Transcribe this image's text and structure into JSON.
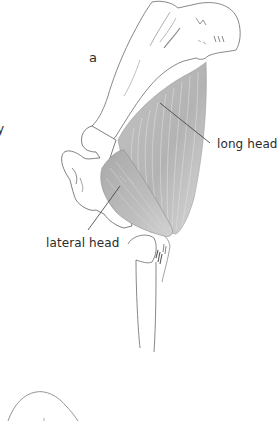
{
  "figure": {
    "panel_label": "a",
    "cut_off_left_text": "y",
    "labels": {
      "long_head": "long head",
      "lateral_head": "lateral head"
    },
    "colors": {
      "background": "#ffffff",
      "bone_outline": "#5a5a5a",
      "muscle_fill": "#b9b9b9",
      "muscle_fill_light": "#d4d4d4",
      "muscle_fiber": "#e6e6e6",
      "leader_line": "#3a3a3a",
      "label_text": "#2b2b2b"
    }
  }
}
